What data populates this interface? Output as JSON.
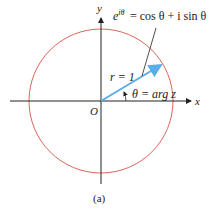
{
  "diagram": {
    "axes": {
      "x_label": "x",
      "y_label": "y",
      "origin_label": "O"
    },
    "circle": {
      "color": "#d9675a",
      "label": "unit circle"
    },
    "vector": {
      "color": "#5aaee6",
      "length_label": "r = 1"
    },
    "angle_label": "θ = arg z",
    "euler_formula": {
      "lhs_base": "e",
      "lhs_exp": "iθ",
      "rhs": "= cos θ + i sin θ"
    },
    "caption": "(a)",
    "colors": {
      "axis": "#222222",
      "circle": "#d9675a",
      "vector": "#5aaee6"
    }
  }
}
